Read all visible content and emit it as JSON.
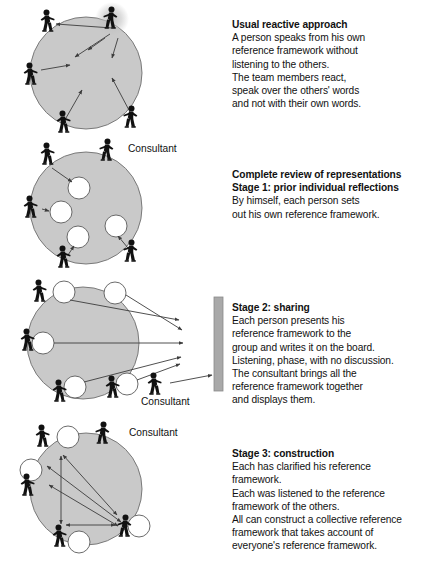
{
  "document": {
    "title": "Complete review of representations - consultation stages diagram",
    "background": "#ffffff",
    "text_color": "#111111"
  },
  "palette": {
    "circle_fill": "#c9c9c9",
    "circle_stroke": "#6e6e6e",
    "node_fill": "#ffffff",
    "node_stroke": "#5a5a5a",
    "person_color": "#111111",
    "arrow_color": "#3c3c3c",
    "board_fill": "#a9a9a9",
    "board_stroke": "#8a8a8a",
    "halo_color": "#c0c0c0"
  },
  "panels": [
    {
      "id": "panel-1",
      "name": "usual-reactive-approach-diagram",
      "circle": {
        "cx": 86,
        "cy": 73,
        "r": 56
      },
      "speaker_index": 1,
      "people": [
        {
          "x": 29,
          "y": 75,
          "flip": false
        },
        {
          "x": 112,
          "y": 19,
          "flip": true
        },
        {
          "x": 46,
          "y": 22,
          "flip": false
        },
        {
          "x": 62,
          "y": 123,
          "flip": false
        },
        {
          "x": 132,
          "y": 118,
          "flip": true
        }
      ],
      "arrows": [
        {
          "x1": 112,
          "y1": 28,
          "x2": 56,
          "y2": 24
        },
        {
          "x1": 110,
          "y1": 34,
          "x2": 75,
          "y2": 57
        },
        {
          "x1": 105,
          "y1": 38,
          "x2": 88,
          "y2": 50
        },
        {
          "x1": 118,
          "y1": 38,
          "x2": 112,
          "y2": 58
        },
        {
          "x1": 41,
          "y1": 70,
          "x2": 70,
          "y2": 65
        },
        {
          "x1": 66,
          "y1": 118,
          "x2": 82,
          "y2": 90
        },
        {
          "x1": 130,
          "y1": 112,
          "x2": 112,
          "y2": 78
        }
      ]
    },
    {
      "id": "panel-2",
      "name": "stage-1-prior-individual-reflections-diagram",
      "circle": {
        "cx": 86,
        "cy": 208,
        "r": 56
      },
      "people": [
        {
          "x": 29,
          "y": 208,
          "flip": false
        },
        {
          "x": 46,
          "y": 155,
          "flip": false
        },
        {
          "x": 108,
          "y": 151,
          "flip": true
        },
        {
          "x": 62,
          "y": 258,
          "flip": false
        },
        {
          "x": 132,
          "y": 252,
          "flip": true
        }
      ],
      "nodes": [
        {
          "cx": 79,
          "cy": 188,
          "r": 11
        },
        {
          "cx": 61,
          "cy": 212,
          "r": 11
        },
        {
          "cx": 78,
          "cy": 237,
          "r": 11
        },
        {
          "cx": 116,
          "cy": 226,
          "r": 11
        }
      ],
      "arrows": [
        {
          "x1": 52,
          "y1": 168,
          "x2": 72,
          "y2": 182
        },
        {
          "x1": 42,
          "y1": 209,
          "x2": 49,
          "y2": 211
        },
        {
          "x1": 68,
          "y1": 255,
          "x2": 74,
          "y2": 246
        },
        {
          "x1": 128,
          "y1": 248,
          "x2": 118,
          "y2": 236
        }
      ]
    },
    {
      "id": "panel-3",
      "name": "stage-2-sharing-diagram",
      "circle": {
        "cx": 83,
        "cy": 343,
        "r": 56
      },
      "people": [
        {
          "x": 26,
          "y": 341,
          "flip": false
        },
        {
          "x": 38,
          "y": 292,
          "flip": false
        },
        {
          "x": 58,
          "y": 392,
          "flip": false
        },
        {
          "x": 111,
          "y": 388,
          "flip": false
        },
        {
          "x": 153,
          "y": 385,
          "flip": false
        }
      ],
      "nodes": [
        {
          "cx": 64,
          "cy": 292,
          "r": 11
        },
        {
          "cx": 115,
          "cy": 293,
          "r": 11
        },
        {
          "cx": 43,
          "cy": 343,
          "r": 11
        },
        {
          "cx": 75,
          "cy": 387,
          "r": 11
        },
        {
          "cx": 127,
          "cy": 384,
          "r": 11
        }
      ],
      "arrows": [
        {
          "x1": 70,
          "y1": 300,
          "x2": 179,
          "y2": 320
        },
        {
          "x1": 126,
          "y1": 295,
          "x2": 182,
          "y2": 330
        },
        {
          "x1": 54,
          "y1": 343,
          "x2": 183,
          "y2": 343
        },
        {
          "x1": 84,
          "y1": 382,
          "x2": 181,
          "y2": 357
        },
        {
          "x1": 137,
          "y1": 380,
          "x2": 180,
          "y2": 364
        },
        {
          "x1": 170,
          "y1": 383,
          "x2": 212,
          "y2": 375
        }
      ],
      "board": {
        "x": 214,
        "y": 297,
        "w": 9,
        "h": 94
      }
    },
    {
      "id": "panel-4",
      "name": "stage-3-construction-diagram",
      "circle": {
        "cx": 86,
        "cy": 489,
        "r": 56
      },
      "people": [
        {
          "x": 26,
          "y": 486,
          "flip": false
        },
        {
          "x": 41,
          "y": 437,
          "flip": false
        },
        {
          "x": 104,
          "y": 434,
          "flip": true
        },
        {
          "x": 58,
          "y": 537,
          "flip": false
        },
        {
          "x": 126,
          "y": 527,
          "flip": true
        }
      ],
      "nodes": [
        {
          "cx": 68,
          "cy": 437,
          "r": 11
        },
        {
          "cx": 31,
          "cy": 470,
          "r": 11
        },
        {
          "cx": 79,
          "cy": 542,
          "r": 11
        },
        {
          "cx": 139,
          "cy": 526,
          "r": 11
        }
      ],
      "arrows": [
        {
          "x1": 61,
          "y1": 524,
          "x2": 61,
          "y2": 456,
          "both": true
        },
        {
          "x1": 47,
          "y1": 466,
          "x2": 121,
          "y2": 522,
          "both": true
        },
        {
          "x1": 49,
          "y1": 485,
          "x2": 118,
          "y2": 526,
          "both": true
        },
        {
          "x1": 66,
          "y1": 525,
          "x2": 115,
          "y2": 525,
          "both": true
        },
        {
          "x1": 117,
          "y1": 515,
          "x2": 63,
          "y2": 455,
          "both": true
        }
      ]
    }
  ],
  "text_blocks": [
    {
      "id": "block-1",
      "name": "usual-reactive-approach-text",
      "heading": [
        "Usual reactive approach"
      ],
      "lines": [
        "A person speaks from his own",
        "reference framework without",
        "listening to the others.",
        "The team members react,",
        "speak over the others' words",
        "and not with their own words."
      ]
    },
    {
      "id": "block-2",
      "name": "stage-1-text",
      "heading": [
        "Complete review of representations",
        "Stage 1: prior individual reflections"
      ],
      "lines": [
        "By himself, each person sets",
        "out his own reference framework."
      ]
    },
    {
      "id": "block-3",
      "name": "stage-2-text",
      "heading": [
        "Stage 2: sharing"
      ],
      "lines": [
        "Each person presents his",
        "reference framework to the",
        "group and writes it on the board.",
        "Listening, phase, with no discussion.",
        "The consultant brings all the",
        "reference framework together",
        "and displays them."
      ]
    },
    {
      "id": "block-4",
      "name": "stage-3-text",
      "heading": [
        "Stage 3: construction"
      ],
      "lines": [
        "Each has clarified his reference",
        "framework.",
        "Each was listened to the reference",
        "framework of the others.",
        "All can construct a collective reference",
        "framework that takes account of",
        "everyone's reference framework."
      ]
    }
  ],
  "consultant_labels": {
    "panel_2": "Consultant",
    "panel_3": "Consultant",
    "panel_4": "Consultant"
  }
}
